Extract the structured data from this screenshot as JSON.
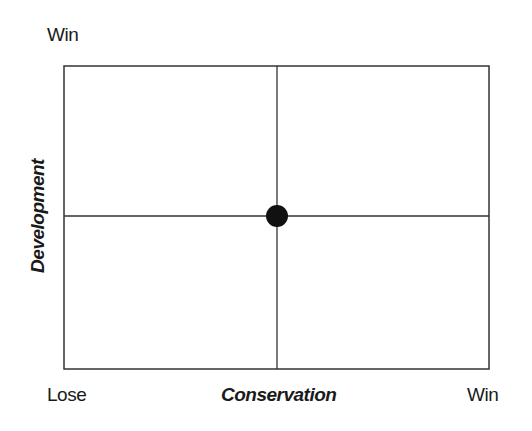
{
  "diagram": {
    "type": "quadrant",
    "y_axis": {
      "title": "Development",
      "top_label": "Win"
    },
    "x_axis": {
      "title": "Conservation",
      "left_label": "Lose",
      "right_label": "Win"
    },
    "point": {
      "x": 0.5,
      "y": 0.5,
      "label": ""
    },
    "colors": {
      "line": "#333333",
      "point": "#111111"
    }
  }
}
